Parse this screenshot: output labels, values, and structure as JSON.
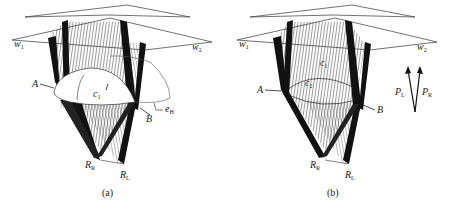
{
  "figure": {
    "panels": [
      {
        "id": "a",
        "caption": "(a)",
        "labels": {
          "w1": {
            "main": "w",
            "sub": "1"
          },
          "w2": {
            "main": "w",
            "sub": "2"
          },
          "A": "A",
          "B": "B",
          "c1": {
            "main": "c",
            "sub": "1"
          },
          "eH": {
            "main": "e",
            "sub": "H"
          },
          "RR": {
            "main": "R",
            "sub": "R"
          },
          "RL": {
            "main": "R",
            "sub": "L"
          }
        }
      },
      {
        "id": "b",
        "caption": "(b)",
        "labels": {
          "w1": {
            "main": "w",
            "sub": "1"
          },
          "w2": {
            "main": "w",
            "sub": "2"
          },
          "A": "A",
          "B": "B",
          "c1": {
            "main": "c",
            "sub": "1"
          },
          "c2": {
            "main": "c",
            "sub": "2"
          },
          "RR": {
            "main": "R",
            "sub": "R"
          },
          "RL": {
            "main": "R",
            "sub": "L"
          },
          "PL": {
            "main": "P",
            "sub": "L"
          },
          "PR": {
            "main": "P",
            "sub": "R"
          }
        }
      }
    ],
    "colors": {
      "ink": "#111111",
      "background": "#ffffff",
      "hatch": "#333333"
    }
  }
}
